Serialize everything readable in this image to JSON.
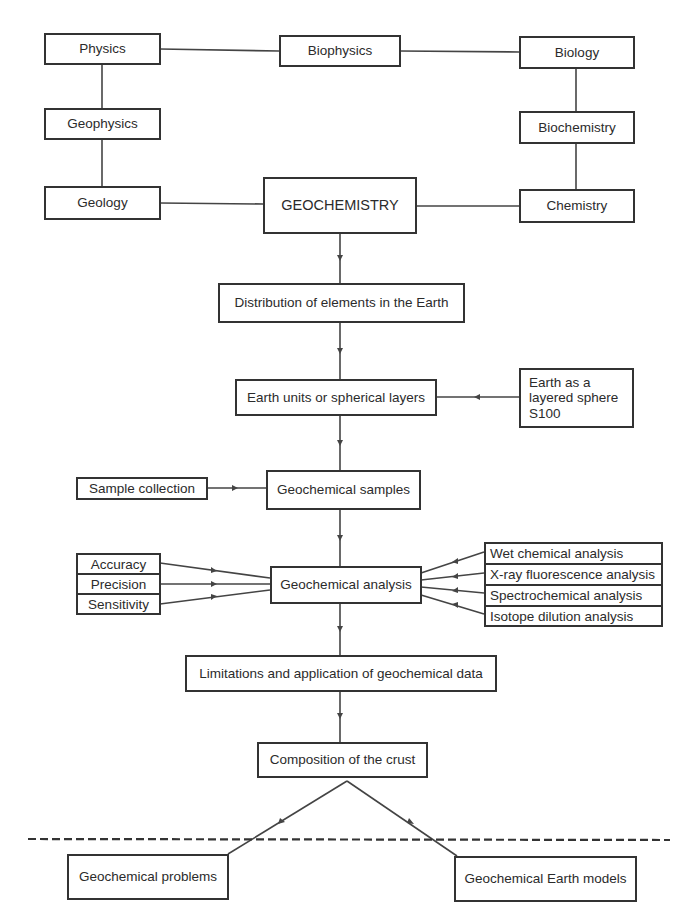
{
  "diagram": {
    "type": "flowchart",
    "top_row": {
      "physics": "Physics",
      "biophysics": "Biophysics",
      "biology": "Biology"
    },
    "left_column": {
      "geophysics": "Geophysics",
      "geology": "Geology"
    },
    "right_column": {
      "biochemistry": "Biochemistry",
      "chemistry": "Chemistry"
    },
    "center": {
      "geochemistry": "GEOCHEMISTRY",
      "distribution": "Distribution of elements in the Earth",
      "earth_units": "Earth units or spherical layers",
      "samples": "Geochemical samples",
      "analysis": "Geochemical analysis",
      "limitations": "Limitations and application of geochemical data",
      "composition": "Composition of the crust"
    },
    "side_inputs": {
      "layered_sphere": [
        "Earth as a",
        "layered  sphere",
        "S100"
      ],
      "sample_collection": "Sample collection",
      "quality_criteria": [
        "Accuracy",
        "Precision",
        "Sensitivity"
      ],
      "analysis_methods": [
        "Wet  chemical analysis",
        "X-ray fluorescence analysis",
        "Spectrochemical analysis",
        "Isotope dilution analysis"
      ]
    },
    "outputs": {
      "problems": "Geochemical problems",
      "earth_models": "Geochemical Earth models"
    },
    "line_color": "#444444",
    "box_border_color": "#333333"
  }
}
